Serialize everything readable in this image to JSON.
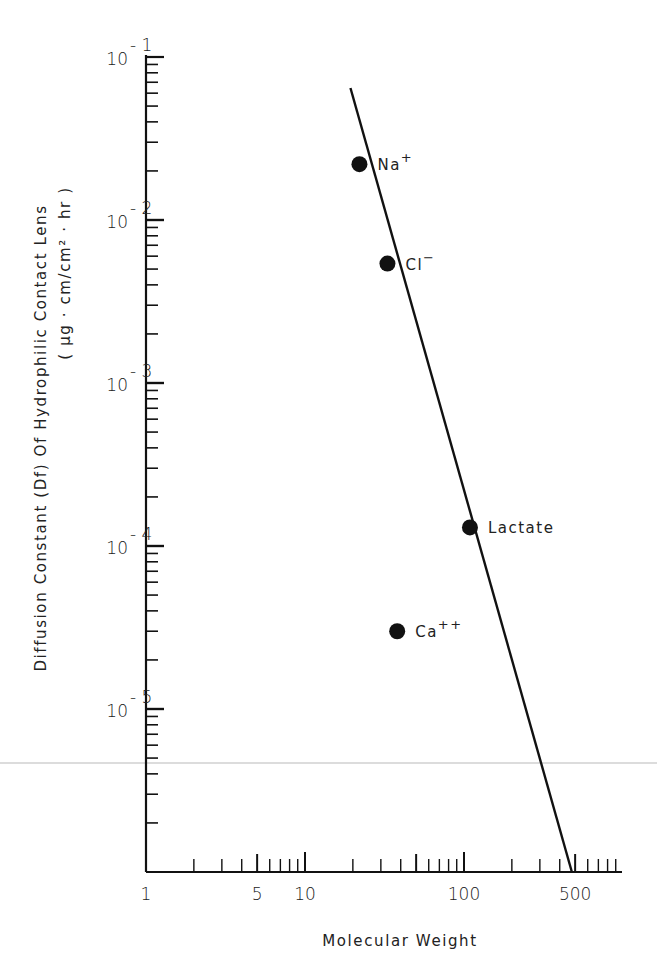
{
  "chart_data": {
    "type": "scatter",
    "title": "",
    "xlabel": "Molecular Weight",
    "ylabel": "Diffusion Constant (Df) Of Hydrophilic Contact Lens",
    "ylabel_units": "( μg · cm/cm² · hr )",
    "xscale": "log",
    "yscale": "log",
    "xlim": [
      1,
      900
    ],
    "ylim": [
      1e-06,
      0.1
    ],
    "grid": false,
    "x_tick_labels": [
      "1",
      "5",
      "10",
      "100",
      "500"
    ],
    "y_tick_labels": [
      {
        "base": "10",
        "exp": "-1"
      },
      {
        "base": "10",
        "exp": "-2"
      },
      {
        "base": "10",
        "exp": "-3"
      },
      {
        "base": "10",
        "exp": "-4"
      },
      {
        "base": "10",
        "exp": "-5"
      }
    ],
    "points": [
      {
        "label": "Na",
        "sup": "+",
        "x": 22,
        "y": 0.022
      },
      {
        "label": "Cl",
        "sup": "−",
        "x": 33,
        "y": 0.0054
      },
      {
        "label": "Lactate",
        "sup": "",
        "x": 109,
        "y": 0.00013
      },
      {
        "label": "Ca",
        "sup": "++",
        "x": 38,
        "y": 3e-05
      }
    ],
    "fit_line": {
      "x": [
        16,
        470
      ],
      "y": [
        0.06,
        1e-06
      ],
      "note": "straight line through Na+, Cl-, Lactate; Ca++ lies off the line"
    }
  }
}
